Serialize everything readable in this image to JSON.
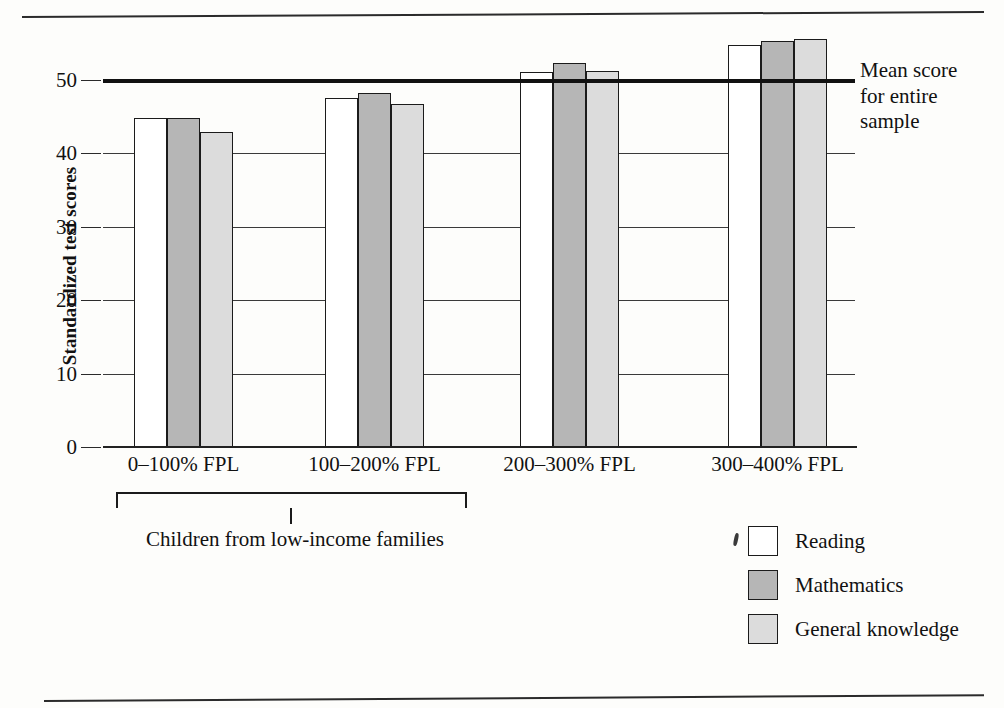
{
  "chart_data": {
    "type": "bar",
    "title": "",
    "xlabel": "",
    "ylabel": "Standardized test scores",
    "ylim": [
      0,
      60
    ],
    "yticks": [
      0,
      10,
      20,
      30,
      40,
      50
    ],
    "ytick_labels": [
      "0",
      "10",
      "20",
      "30",
      "40",
      "50"
    ],
    "grid": true,
    "legend_position": "bottom-right",
    "categories": [
      "0–100% FPL",
      "100–200% FPL",
      "200–300% FPL",
      "300–400% FPL"
    ],
    "series": [
      {
        "name": "Reading",
        "color": "#ffffff",
        "values": [
          44.8,
          47.5,
          51.1,
          54.8
        ]
      },
      {
        "name": "Mathematics",
        "color": "#b6b6b6",
        "values": [
          44.8,
          48.2,
          52.3,
          55.3
        ]
      },
      {
        "name": "General knowledge",
        "color": "#dcdcdc",
        "values": [
          42.9,
          46.7,
          51.2,
          55.6
        ]
      }
    ],
    "annotations": [
      {
        "name": "mean-line",
        "label": "Mean score for entire sample",
        "value": 50,
        "orientation": "horizontal"
      },
      {
        "name": "low-income-bracket",
        "label": "Children from low-income families",
        "spans": [
          "0–100% FPL",
          "100–200% FPL"
        ]
      }
    ]
  },
  "axis": {
    "y_title": "Standardized test scores",
    "y_ticks": [
      "50",
      "40",
      "30",
      "20",
      "10",
      "0"
    ]
  },
  "mean_annotation": {
    "line1": "Mean score",
    "line2": "for entire",
    "line3": "sample"
  },
  "bracket": {
    "label": "Children from low-income families"
  },
  "legend": {
    "items": [
      {
        "label": "Reading",
        "swatch": "white-square-icon"
      },
      {
        "label": "Mathematics",
        "swatch": "dark-gray-square-icon"
      },
      {
        "label": "General knowledge",
        "swatch": "light-gray-square-icon"
      }
    ]
  },
  "colors": {
    "reading": "#ffffff",
    "mathematics": "#b6b6b6",
    "general_knowledge": "#dcdcdc",
    "ink": "#1b1b1b",
    "page": "#fdfdfb"
  }
}
